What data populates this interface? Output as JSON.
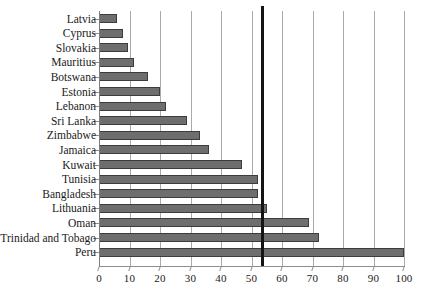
{
  "chart_data": {
    "type": "bar",
    "orientation": "horizontal",
    "title": "",
    "subtitle": "",
    "xlabel": "",
    "ylabel": "",
    "xlim": [
      0,
      100
    ],
    "ylim": null,
    "grid": true,
    "legend": null,
    "categories": [
      "Latvia",
      "Cyprus",
      "Slovakia",
      "Mauritius",
      "Botswana",
      "Estonia",
      "Lebanon",
      "Sri Lanka",
      "Zimbabwe",
      "Jamaica",
      "Kuwait",
      "Tunisia",
      "Bangladesh",
      "Lithuania",
      "Oman",
      "Trinidad and Tobago",
      "Peru"
    ],
    "values": [
      6,
      8,
      9.5,
      11.5,
      16,
      20,
      22,
      29,
      33,
      36,
      47,
      52,
      52,
      55,
      69,
      72,
      100
    ],
    "xticks": [
      0,
      10,
      20,
      30,
      40,
      50,
      60,
      70,
      80,
      90,
      100
    ],
    "xtick_labels": [
      "0",
      "10",
      "20",
      "30",
      "40",
      "50",
      "60",
      "70",
      "80",
      "90",
      "100"
    ],
    "annotations": [
      {
        "name": "reference-line",
        "type": "vertical-line",
        "value": 53,
        "color": "#141414"
      }
    ],
    "colors": {
      "bar_fill": "#6e6e6e",
      "bar_edge": "#3c3c3c",
      "gridline": "#a9a9ae",
      "axis": "#8c8c92",
      "reference_line": "#141414",
      "background": "#ffffff",
      "text": "#1a1a1a"
    }
  }
}
